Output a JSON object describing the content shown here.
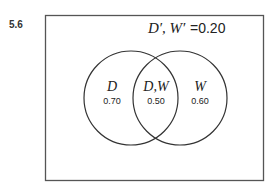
{
  "figure": {
    "number": "5.6",
    "outside_label": {
      "sets": "D′, W′",
      "equals": "=0.20"
    },
    "regions": [
      {
        "name": "D",
        "value": "0.70"
      },
      {
        "name": "D,W",
        "value": "0.50"
      },
      {
        "name": "W",
        "value": "0.60"
      }
    ]
  },
  "colors": {
    "stroke": "#333333",
    "text": "#222222"
  }
}
